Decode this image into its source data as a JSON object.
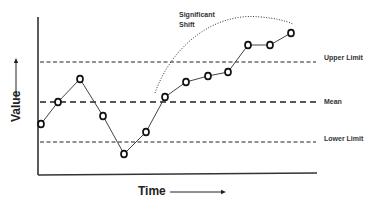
{
  "chart_data": {
    "type": "line",
    "title": "",
    "xlabel": "Time",
    "ylabel": "Value",
    "grid": false,
    "legend": null,
    "x": [
      1,
      2,
      3,
      4,
      5,
      6,
      7,
      8,
      9,
      10,
      11,
      12,
      13
    ],
    "series": [
      {
        "name": "Process value",
        "values": [
          -1.1,
          0.0,
          1.15,
          -0.7,
          -2.6,
          -1.5,
          0.25,
          1.0,
          1.3,
          1.5,
          2.85,
          2.85,
          3.45
        ]
      }
    ],
    "reference_lines": [
      {
        "name": "Upper Limit",
        "value": 2.0,
        "style": "dashed"
      },
      {
        "name": "Mean",
        "value": 0.0,
        "style": "dashed-bold"
      },
      {
        "name": "Lower Limit",
        "value": -2.0,
        "style": "dashed"
      }
    ],
    "annotations": [
      {
        "text": "Significant Shift",
        "type": "dotted-arc",
        "spans_points": [
          7,
          13
        ]
      }
    ],
    "ylim": [
      -3.6,
      4.25
    ],
    "xlim": [
      0.85,
      13.95
    ]
  },
  "labels": {
    "upper_limit": "Upper Limit",
    "mean": "Mean",
    "lower_limit": "Lower Limit",
    "shift_line1": "Significant",
    "shift_line2": "Shift",
    "x_axis": "Time",
    "y_axis": "Value"
  }
}
